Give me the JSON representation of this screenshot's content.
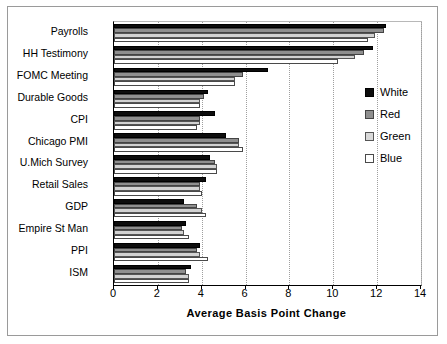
{
  "chart_data": {
    "type": "bar",
    "orientation": "horizontal",
    "title": "",
    "xlabel": "Average Basis Point Change",
    "ylabel": "",
    "xlim": [
      0,
      14
    ],
    "xticks": [
      0,
      2,
      4,
      6,
      8,
      10,
      12,
      14
    ],
    "grid": true,
    "legend_position": "right",
    "categories": [
      "Payrolls",
      "HH Testimony",
      "FOMC Meeting",
      "Durable Goods",
      "CPI",
      "Chicago PMI",
      "U.Mich Survey",
      "Retail Sales",
      "GDP",
      "Empire St Man",
      "PPI",
      "ISM"
    ],
    "series": [
      {
        "name": "White",
        "color": "#0d0d0d",
        "values": [
          12.4,
          11.8,
          7.0,
          4.3,
          4.6,
          5.1,
          4.4,
          4.2,
          3.2,
          3.3,
          3.9,
          3.5
        ]
      },
      {
        "name": "Red",
        "color": "#8f8f8f",
        "values": [
          12.3,
          11.4,
          5.9,
          4.1,
          3.9,
          5.7,
          4.6,
          3.9,
          3.8,
          3.1,
          3.8,
          3.3
        ]
      },
      {
        "name": "Green",
        "color": "#d2d2d2",
        "values": [
          11.9,
          11.0,
          5.5,
          3.9,
          3.9,
          5.7,
          4.7,
          3.9,
          4.0,
          3.2,
          3.9,
          3.4
        ]
      },
      {
        "name": "Blue",
        "color": "#ffffff",
        "values": [
          11.6,
          10.2,
          5.5,
          3.9,
          3.8,
          5.9,
          4.7,
          4.0,
          4.2,
          3.4,
          4.3,
          3.4
        ]
      }
    ]
  },
  "axis": {
    "tick_labels": [
      "0",
      "2",
      "4",
      "6",
      "8",
      "10",
      "12",
      "14"
    ],
    "x_title": "Average Basis Point Change"
  },
  "legend": {
    "entries": [
      {
        "label": "White"
      },
      {
        "label": "Red"
      },
      {
        "label": "Green"
      },
      {
        "label": "Blue"
      }
    ]
  }
}
